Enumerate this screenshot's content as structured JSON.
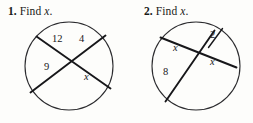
{
  "worksheet": {
    "problems": [
      {
        "number": "1.",
        "instruction": "Find",
        "variable": "x",
        "period": ".",
        "figure": {
          "shape": "circle",
          "description": "Two intersecting chords inside a circle",
          "segment_labels": [
            {
              "id": "seg-12",
              "text": "12"
            },
            {
              "id": "seg-4",
              "text": "4"
            },
            {
              "id": "seg-9",
              "text": "9"
            },
            {
              "id": "seg-x",
              "text": "x"
            }
          ]
        }
      },
      {
        "number": "2.",
        "instruction": "Find",
        "variable": "x",
        "period": ".",
        "figure": {
          "shape": "circle",
          "description": "Two intersecting chords inside a circle",
          "segment_labels": [
            {
              "id": "seg-x-upper",
              "text": "x"
            },
            {
              "id": "seg-2",
              "text": "2"
            },
            {
              "id": "seg-8",
              "text": "8"
            },
            {
              "id": "seg-x-lower",
              "text": "x"
            }
          ]
        }
      }
    ]
  },
  "style": {
    "ink_color": "#17171a",
    "paper_color": "#fdfdfb",
    "stroke_thin": "#2b2b2e"
  }
}
